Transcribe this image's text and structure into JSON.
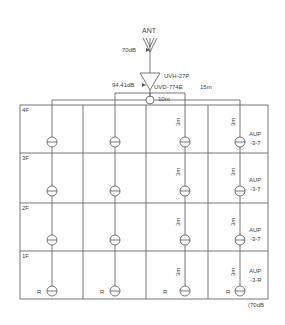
{
  "diagram": {
    "antenna": {
      "label": "ANT",
      "level": "70dB"
    },
    "amplifier": {
      "model": "UVH-27P",
      "output_level": "94.41dB"
    },
    "distributor": {
      "model": "UVD-774E"
    },
    "cable_lengths": {
      "right_run": "15m",
      "left_run": "10m",
      "riser": "3m"
    },
    "floors": [
      "4F",
      "3F",
      "2F",
      "1F"
    ],
    "outlet_models": [
      "AUP-3-7",
      "AUP-3-7",
      "AUP-3-7",
      "AUP-3-R"
    ],
    "outlet_model_lines": [
      [
        "AUP",
        "-3-7"
      ],
      [
        "AUP",
        "-3-7"
      ],
      [
        "AUP",
        "-3-7"
      ],
      [
        "AUP",
        "-3-R"
      ]
    ],
    "terminal_mark": "R",
    "end_level": "(70dB"
  }
}
